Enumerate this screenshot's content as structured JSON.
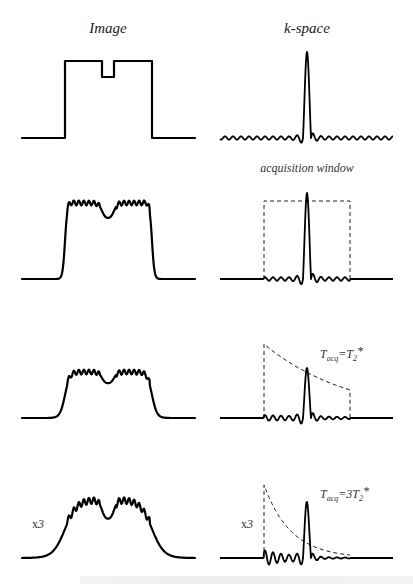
{
  "figure": {
    "columns": [
      {
        "id": "image",
        "title": "Image"
      },
      {
        "id": "kspace",
        "title": "k-space"
      }
    ],
    "rows": [
      {
        "id": "ideal",
        "image": {
          "baseline_y": 138,
          "top_y": 61,
          "notch_y": 77,
          "ringing": false,
          "edge": "sharp",
          "scale_label": ""
        },
        "kspace": {
          "baseline_y": 138,
          "peak_y": 52,
          "window": "none",
          "annotation": "",
          "scale_label": "",
          "full_extent": true
        }
      },
      {
        "id": "truncated",
        "image": {
          "baseline_y": 279,
          "top_y": 203,
          "notch_y": 219,
          "ringing": true,
          "edge": "steep",
          "scale_label": ""
        },
        "kspace": {
          "baseline_y": 279,
          "peak_y": 193,
          "window": "rect",
          "window_top_y": 201,
          "annotation": "acquisition window",
          "scale_label": ""
        }
      },
      {
        "id": "t2star-1",
        "image": {
          "baseline_y": 418,
          "top_y": 372,
          "notch_y": 384,
          "ringing": true,
          "edge": "soft",
          "scale_label": ""
        },
        "kspace": {
          "baseline_y": 418,
          "peak_y": 368,
          "window": "exp",
          "window_start_y": 344,
          "window_end_y": 390,
          "decay": 1,
          "annotation": {
            "T": "T",
            "sub": "acq",
            "eq": "=T",
            "sub2": "2",
            "star": "*"
          },
          "scale_label": ""
        }
      },
      {
        "id": "t2star-3",
        "image": {
          "baseline_y": 558,
          "top_y": 500,
          "notch_y": 520,
          "ringing": true,
          "edge": "blurred",
          "scale_label": "x3"
        },
        "kspace": {
          "baseline_y": 558,
          "peak_y": 502,
          "window": "exp",
          "window_start_y": 485,
          "window_end_y": 555,
          "decay": 3,
          "annotation": {
            "T": "T",
            "sub": "acq",
            "eq": "=3T",
            "sub2": "2",
            "star": "*"
          },
          "scale_label": "x3"
        }
      }
    ],
    "labels": {
      "acq_window": "acquisition window",
      "tacq_1": {
        "T": "T",
        "sub": "acq",
        "eq": "=T",
        "sub2": "2",
        "star": "*"
      },
      "tacq_3": {
        "T": "T",
        "sub": "acq",
        "eq": "=3T",
        "sub2": "2",
        "star": "*"
      },
      "scale_image": {
        "x": "x",
        "n": "3"
      },
      "scale_kspace": {
        "x": "x",
        "n": "3"
      }
    },
    "colors": {
      "trace": "#000000",
      "window": "#222222",
      "text": "#222222",
      "background": "#ffffff"
    }
  }
}
